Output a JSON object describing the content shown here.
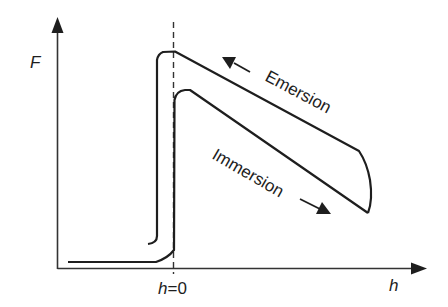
{
  "diagram": {
    "type": "hysteresis-force-curve",
    "axes": {
      "y_label": "F",
      "x_label": "h",
      "x_tick_var": "h",
      "x_tick_eq": "=0"
    },
    "curves": [
      {
        "name": "Emersion",
        "direction": "leftward (decreasing h)"
      },
      {
        "name": "Immersion",
        "direction": "rightward (increasing h)"
      }
    ],
    "labels": {
      "emersion": "Emersion",
      "immersion": "Immersion"
    },
    "colors": {
      "line": "#1e1e1e",
      "background": "#ffffff"
    }
  }
}
